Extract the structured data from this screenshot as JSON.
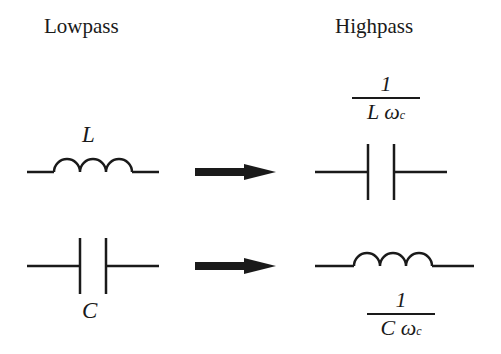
{
  "headers": {
    "lowpass": "Lowpass",
    "highpass": "Highpass"
  },
  "lowpass": {
    "inductor_label": "L",
    "capacitor_label": "C"
  },
  "highpass": {
    "capacitor_value": {
      "numerator": "1",
      "denominator_main": "L ω",
      "denominator_sub": "c"
    },
    "inductor_value": {
      "numerator": "1",
      "denominator_main": "C  ω",
      "denominator_sub": "c"
    }
  },
  "colors": {
    "stroke": "#1a1a1a",
    "background": "#ffffff"
  }
}
